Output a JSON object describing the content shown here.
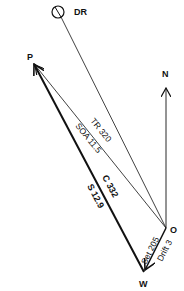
{
  "diagram": {
    "type": "current-sailing vector diagram",
    "colors": {
      "line": "#111111",
      "background": "#ffffff"
    },
    "points": {
      "dr": {
        "label": "DR",
        "x": 58,
        "y": 12
      },
      "p": {
        "label": "P",
        "x": 33,
        "y": 63
      },
      "n": {
        "label": "N",
        "x": 166,
        "y": 88
      },
      "o": {
        "label": "O",
        "x": 166,
        "y": 228
      },
      "w": {
        "label": "W",
        "x": 144,
        "y": 272
      }
    },
    "vectors": {
      "track": {
        "label1": "TR 320",
        "label2": "SOA 11.5"
      },
      "course": {
        "label1": "C 332",
        "label2": "S 12.9"
      },
      "current": {
        "label1": "Set 205",
        "label2": "Drift 3"
      }
    }
  }
}
